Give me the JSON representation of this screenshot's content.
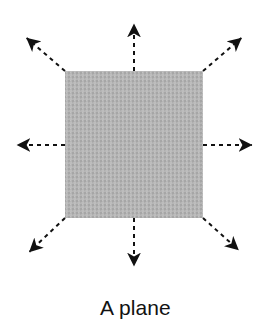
{
  "figure": {
    "caption": "A plane",
    "background_color": "#ffffff",
    "ink_color": "#111111"
  },
  "plane": {
    "label": "plane-square",
    "fill_color": "#b3b3b3",
    "texture": "dithered-halftone-gray",
    "x": 65,
    "y": 71,
    "width": 138,
    "height": 147
  },
  "arrows": {
    "count": 8,
    "style": "dashed-shaft-solid-head",
    "dash_pattern": "4 4",
    "stroke_width": 2,
    "color": "#111111",
    "items": [
      {
        "name": "arrow-up",
        "direction": "up",
        "from_x": 134,
        "from_y": 71,
        "to_x": 134,
        "to_y": 18
      },
      {
        "name": "arrow-down",
        "direction": "down",
        "from_x": 134,
        "from_y": 218,
        "to_x": 134,
        "to_y": 272
      },
      {
        "name": "arrow-left",
        "direction": "left",
        "from_x": 65,
        "from_y": 145,
        "to_x": 11,
        "to_y": 145
      },
      {
        "name": "arrow-right",
        "direction": "right",
        "from_x": 203,
        "from_y": 145,
        "to_x": 258,
        "to_y": 145
      },
      {
        "name": "arrow-up-left",
        "direction": "up-left",
        "from_x": 65,
        "from_y": 71,
        "to_x": 22,
        "to_y": 34
      },
      {
        "name": "arrow-up-right",
        "direction": "up-right",
        "from_x": 203,
        "from_y": 71,
        "to_x": 246,
        "to_y": 34
      },
      {
        "name": "arrow-down-left",
        "direction": "down-left",
        "from_x": 65,
        "from_y": 218,
        "to_x": 25,
        "to_y": 256
      },
      {
        "name": "arrow-down-right",
        "direction": "down-right",
        "from_x": 203,
        "from_y": 218,
        "to_x": 243,
        "to_y": 254
      }
    ]
  }
}
